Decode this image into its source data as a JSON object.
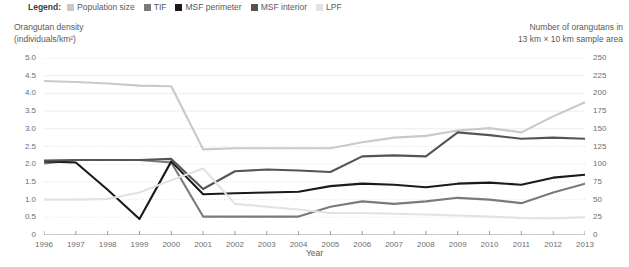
{
  "legend": {
    "title": "Legend:",
    "items": [
      {
        "label": "Population size",
        "color": "#c9c9c9",
        "key": "population_size"
      },
      {
        "label": "TIF",
        "color": "#7a7a7a",
        "key": "tif"
      },
      {
        "label": "MSF perimeter",
        "color": "#1a1a1a",
        "key": "msf_perimeter"
      },
      {
        "label": "MSF interior",
        "color": "#555555",
        "key": "msf_interior"
      },
      {
        "label": "LPF",
        "color": "#e2e2e2",
        "key": "lpf"
      }
    ]
  },
  "axis_headers": {
    "left_line1": "Orangutan density",
    "left_line2": "(individuals/km²)",
    "right_line1": "Number of orangutans in",
    "right_line2": "13 km × 10 km sample area"
  },
  "chart_data": {
    "type": "line",
    "title": "",
    "xlabel": "Year",
    "ylabel": "Orangutan density (individuals/km²)",
    "ylabel_right": "Number of orangutans in 13 km × 10 km sample area",
    "grid": true,
    "legend_position": "top-left",
    "x": [
      1996,
      1997,
      1998,
      1999,
      2000,
      2001,
      2002,
      2003,
      2004,
      2005,
      2006,
      2007,
      2008,
      2009,
      2010,
      2011,
      2012,
      2013
    ],
    "categories": [
      "1996",
      "1997",
      "1998",
      "1999",
      "2000",
      "2001",
      "2002",
      "2003",
      "2004",
      "2005",
      "2006",
      "2007",
      "2008",
      "2009",
      "2010",
      "2011",
      "2012",
      "2013"
    ],
    "ylim": [
      0,
      5.0
    ],
    "yticks": [
      "0",
      "0.5",
      "1.0",
      "1.5",
      "2.0",
      "2.5",
      "3.0",
      "3.5",
      "4.0",
      "4.5",
      "5.0"
    ],
    "ylim_right": [
      0,
      250
    ],
    "yticks_right": [
      "0",
      "25",
      "50",
      "75",
      "100",
      "125",
      "150",
      "175",
      "200",
      "225",
      "250"
    ],
    "series": [
      {
        "name": "Population size",
        "color": "#c9c9c9",
        "values": [
          4.35,
          4.32,
          4.28,
          4.22,
          4.2,
          2.42,
          2.45,
          2.45,
          2.45,
          2.45,
          2.62,
          2.75,
          2.8,
          2.95,
          3.02,
          2.9,
          3.35,
          3.75
        ]
      },
      {
        "name": "TIF",
        "color": "#7a7a7a",
        "values": [
          2.02,
          2.12,
          2.12,
          2.12,
          2.05,
          0.52,
          0.52,
          0.52,
          0.52,
          0.8,
          0.95,
          0.88,
          0.95,
          1.05,
          1.0,
          0.9,
          1.2,
          1.45
        ]
      },
      {
        "name": "MSF perimeter",
        "color": "#1a1a1a",
        "values": [
          2.08,
          2.05,
          1.28,
          0.45,
          2.08,
          1.15,
          1.18,
          1.2,
          1.22,
          1.38,
          1.45,
          1.42,
          1.35,
          1.45,
          1.48,
          1.42,
          1.62,
          1.7
        ]
      },
      {
        "name": "MSF interior",
        "color": "#555555",
        "values": [
          2.1,
          2.12,
          2.12,
          2.12,
          2.15,
          1.3,
          1.8,
          1.85,
          1.82,
          1.78,
          2.22,
          2.25,
          2.22,
          2.9,
          2.82,
          2.72,
          2.75,
          2.72
        ]
      },
      {
        "name": "LPF",
        "color": "#e2e2e2",
        "values": [
          1.0,
          1.0,
          1.02,
          1.2,
          1.55,
          1.88,
          0.88,
          0.8,
          0.72,
          0.62,
          0.62,
          0.6,
          0.58,
          0.55,
          0.52,
          0.48,
          0.47,
          0.5
        ]
      }
    ]
  }
}
